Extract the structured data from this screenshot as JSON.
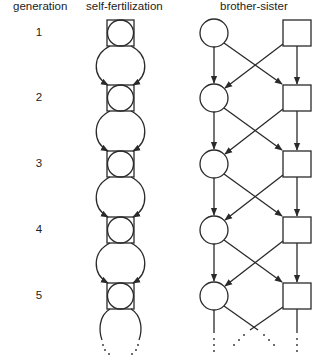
{
  "headers": {
    "generation": "generation",
    "self_fertilization": "self-fertilization",
    "brother_sister": "brother-sister"
  },
  "generations": [
    "1",
    "2",
    "3",
    "4",
    "5"
  ],
  "symbols": {
    "circle": "female (circle-icon)",
    "square": "male (square-icon)"
  },
  "layout": {
    "row_y": [
      33,
      98,
      164,
      230,
      296
    ],
    "stroke_color": "#2a2a2a"
  }
}
